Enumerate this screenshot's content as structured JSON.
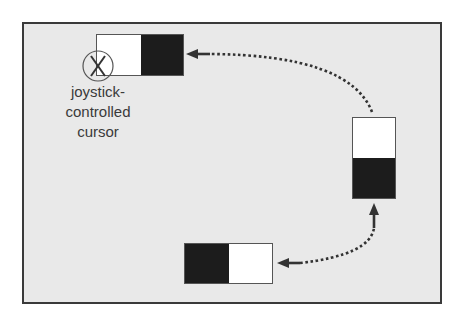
{
  "diagram": {
    "label": {
      "lines": [
        "joystick-",
        "controlled",
        "cursor"
      ]
    },
    "targets": [
      {
        "id": "top-left",
        "orientation": "horizontal",
        "cells": [
          "white",
          "black"
        ]
      },
      {
        "id": "right",
        "orientation": "vertical",
        "cells": [
          "white",
          "black"
        ]
      },
      {
        "id": "bottom",
        "orientation": "horizontal",
        "cells": [
          "black",
          "white"
        ]
      }
    ],
    "cursor_icon": "circled-x-icon",
    "arrows": [
      {
        "from": "bottom",
        "to": "right",
        "style": "dotted"
      },
      {
        "from": "right",
        "to": "top-left",
        "style": "dotted"
      }
    ],
    "colors": {
      "background": "#e9e9e9",
      "frame": "#3a3a3a",
      "dark_cell": "#1c1c1c",
      "light_cell": "#ffffff",
      "text": "#3a3a3a"
    }
  }
}
